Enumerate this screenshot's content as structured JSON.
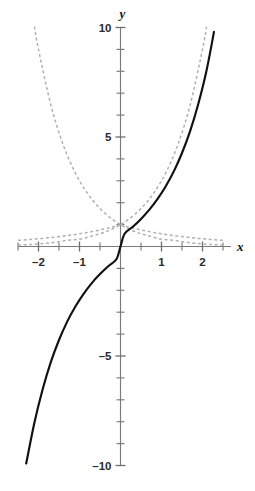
{
  "chart_data": {
    "type": "line",
    "title": "",
    "subtitle": "",
    "xlabel": "x",
    "ylabel": "y",
    "xlim": [
      -2.5,
      2.5
    ],
    "ylim": [
      -10.5,
      10.5
    ],
    "grid": false,
    "legend": "none",
    "axes_style": "centered-cross",
    "x_ticks_major": [
      -2,
      -1,
      1,
      2
    ],
    "x_ticks_minor": [
      -2.5,
      -1.5,
      -0.5,
      0.5,
      1.5,
      2.5
    ],
    "x_tick_labels": [
      "–2",
      "–1",
      "1",
      "2"
    ],
    "y_ticks_major": [
      -10,
      -5,
      5,
      10
    ],
    "y_ticks_minor": [
      -9,
      -8,
      -7,
      -6,
      -4,
      -3,
      -2,
      -1,
      1,
      2,
      3,
      4,
      6,
      7,
      8,
      9
    ],
    "y_tick_labels": [
      "–10",
      "–5",
      "5",
      "10"
    ],
    "x_tick_step": 0.5,
    "y_tick_step": 1,
    "series": [
      {
        "name": "solid-curve",
        "style": "solid",
        "color": "#111111",
        "expression": "y = 3^x - 3^(-x)",
        "x": [
          -2.3,
          -2.1,
          -1.9,
          -1.7,
          -1.5,
          -1.3,
          -1.1,
          -0.9,
          -0.7,
          -0.5,
          -0.3,
          -0.1,
          0.0,
          0.1,
          0.3,
          0.5,
          0.7,
          0.9,
          1.1,
          1.3,
          1.5,
          1.7,
          1.9,
          2.1,
          2.28
        ],
        "y": [
          -9.91,
          -8.05,
          -6.53,
          -5.28,
          -4.27,
          -3.43,
          -2.74,
          -2.16,
          -1.67,
          -1.26,
          -0.9,
          -0.58,
          0.0,
          0.58,
          0.9,
          1.26,
          1.67,
          2.16,
          2.74,
          3.43,
          4.27,
          5.28,
          6.53,
          8.05,
          9.8
        ]
      },
      {
        "name": "dashed-growth-curve",
        "style": "dashed",
        "color": "#b0b0b0",
        "expression": "y = 3^x",
        "x": [
          -2.5,
          -2.2,
          -1.9,
          -1.6,
          -1.3,
          -1.0,
          -0.7,
          -0.4,
          -0.1,
          0.0,
          0.2,
          0.5,
          0.8,
          1.1,
          1.4,
          1.7,
          2.0,
          2.1
        ],
        "y": [
          0.064,
          0.093,
          0.135,
          0.196,
          0.285,
          0.333,
          0.481,
          0.642,
          0.896,
          1.0,
          1.246,
          1.732,
          2.408,
          3.348,
          4.655,
          6.473,
          9.0,
          10.04
        ]
      },
      {
        "name": "dashed-decay-curve",
        "style": "dashed",
        "color": "#b0b0b0",
        "expression": "y = 3^(-x)",
        "x": [
          -2.1,
          -2.0,
          -1.7,
          -1.4,
          -1.1,
          -0.8,
          -0.5,
          -0.2,
          0.0,
          0.1,
          0.4,
          0.7,
          1.0,
          1.3,
          1.6,
          1.9,
          2.2,
          2.5
        ],
        "y": [
          10.04,
          9.0,
          6.473,
          4.655,
          3.348,
          2.408,
          1.732,
          1.246,
          1.0,
          0.896,
          0.642,
          0.481,
          0.333,
          0.285,
          0.196,
          0.135,
          0.093,
          0.064
        ]
      },
      {
        "name": "dashed-flat-left-curve",
        "style": "dashed",
        "color": "#b0b0b0",
        "expression": "y = 1.45^x (shallow)",
        "x": [
          -2.5,
          -2.2,
          -1.9,
          -1.6,
          -1.3,
          -1.0,
          -0.7,
          -0.4,
          -0.2,
          0.0
        ],
        "y": [
          0.28,
          0.32,
          0.37,
          0.43,
          0.5,
          0.58,
          0.68,
          0.8,
          0.89,
          1.0
        ]
      },
      {
        "name": "dashed-flat-right-curve",
        "style": "dashed",
        "color": "#b0b0b0",
        "expression": "y = 1.45^(-x) (shallow)",
        "x": [
          0.0,
          0.2,
          0.4,
          0.7,
          1.0,
          1.3,
          1.6,
          1.9,
          2.2,
          2.5
        ],
        "y": [
          1.0,
          0.89,
          0.8,
          0.68,
          0.58,
          0.5,
          0.43,
          0.37,
          0.32,
          0.28
        ]
      }
    ],
    "annotations": [
      {
        "name": "origin-marker",
        "x": 0,
        "y": 1,
        "note": "curves intersect at (0,1)"
      }
    ]
  },
  "axis": {
    "x_label": "x",
    "y_label": "y"
  },
  "colors": {
    "solid_curve": "#111111",
    "dashed_curve": "#b0b0b0",
    "axis": "#7a7a7a",
    "label": "#2b2b2b",
    "background": "#ffffff"
  }
}
